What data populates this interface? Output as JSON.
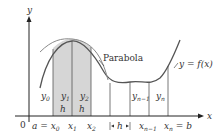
{
  "figure": {
    "colors": {
      "shade": "#d6d6d6",
      "curve": "#555555",
      "parabola": "#8a8a8a",
      "axis": "#222222",
      "text": "#333333",
      "background": "#ffffff"
    },
    "axes": {
      "y_label": "y",
      "x_label": "x",
      "origin_label": "0"
    },
    "labels": {
      "parabola": "Parabola",
      "function": "y = f(x)",
      "y0": "y",
      "y0_sub": "0",
      "y1": "y",
      "y1_sub": "1",
      "y2": "y",
      "y2_sub": "2",
      "yn1": "y",
      "yn1_sub": "n−1",
      "yn": "y",
      "yn_sub": "n",
      "h1": "h",
      "h2": "h",
      "h_interval": "h",
      "a_eq_x0": "a = x",
      "x0_sub": "0",
      "x1": "x",
      "x1_sub": "1",
      "x2": "x",
      "x2_sub": "2",
      "xn1": "x",
      "xn1_sub": "n−1",
      "xn_eq_b": "x",
      "xn_sub": "n",
      "eq_b": " = b"
    }
  }
}
